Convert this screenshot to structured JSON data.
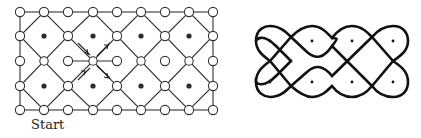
{
  "figure": {
    "start_label": "Start",
    "colors": {
      "line": "#333333",
      "node_fill": "#ffffff",
      "dot": "#2a2a2a",
      "curve": "#111111"
    },
    "grid": {
      "x0": 20,
      "y0": 12,
      "step_x": 24.2,
      "step_y": 24.5,
      "cols": 9,
      "rows": 5,
      "filled_dots": [
        [
          44,
          36
        ],
        [
          93,
          36
        ],
        [
          141,
          36
        ],
        [
          189,
          36
        ],
        [
          44,
          86
        ],
        [
          93,
          86
        ],
        [
          141,
          86
        ],
        [
          189,
          86
        ]
      ]
    },
    "kolam": {
      "dots": [
        [
          270,
          41
        ],
        [
          312,
          41
        ],
        [
          352,
          41
        ],
        [
          393,
          41
        ],
        [
          270,
          82
        ],
        [
          312,
          82
        ],
        [
          352,
          82
        ],
        [
          393,
          82
        ]
      ]
    }
  }
}
